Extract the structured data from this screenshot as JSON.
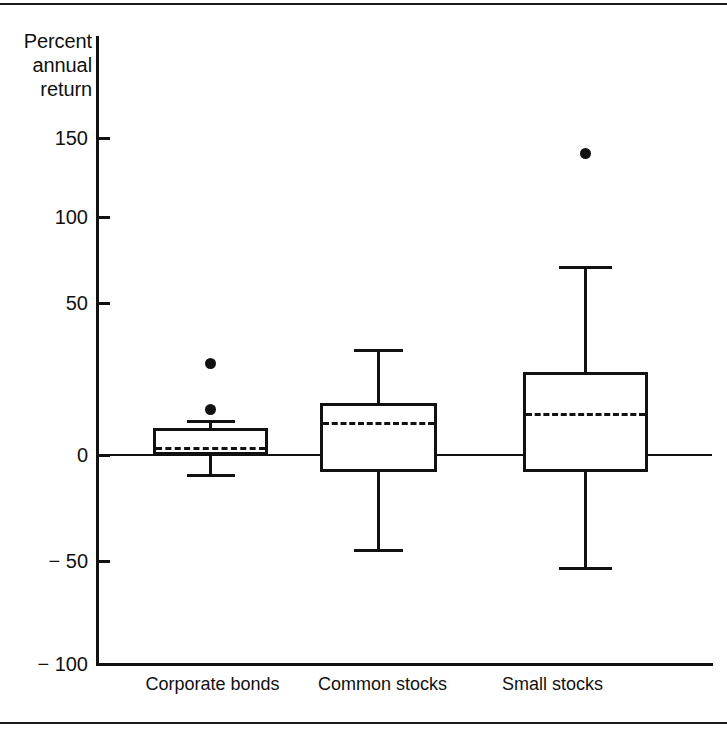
{
  "chart_data": {
    "type": "box",
    "title": "",
    "ylabel": "Percent annual return",
    "xlabel": "",
    "ylim": [
      -100,
      160
    ],
    "yticks": [
      150,
      100,
      50,
      0,
      -50,
      -100
    ],
    "ytick_labels": [
      "150",
      "100",
      "50",
      "0",
      "− 50",
      "− 100"
    ],
    "grid": false,
    "legend": "none",
    "zero_reference_line": true,
    "categories": [
      "Corporate bonds",
      "Common stocks",
      "Small stocks"
    ],
    "boxes": [
      {
        "name": "Corporate bonds",
        "whisker_low": -9,
        "q1": 0,
        "median": 4,
        "q3": 13,
        "whisker_high": 17,
        "outliers": [
          22,
          44
        ]
      },
      {
        "name": "Common stocks",
        "whisker_low": -45,
        "q1": -8,
        "median": 16,
        "q3": 25,
        "whisker_high": 51,
        "outliers": []
      },
      {
        "name": "Small stocks",
        "whisker_low": -54,
        "q1": -8,
        "median": 20,
        "q3": 40,
        "whisker_high": 91,
        "outliers": [
          145
        ]
      }
    ]
  },
  "axis": {
    "title_line1": "Percent",
    "title_line2": "annual",
    "title_line3": "return"
  },
  "ticks": {
    "t150": "150",
    "t100": "100",
    "t50": "50",
    "t0": "0",
    "tm50": "− 50",
    "tm100": "− 100"
  },
  "xlabels": {
    "cat0": "Corporate bonds",
    "cat1": "Common stocks",
    "cat2": "Small stocks"
  },
  "colors": {
    "ink": "#111111",
    "background": "#ffffff"
  }
}
